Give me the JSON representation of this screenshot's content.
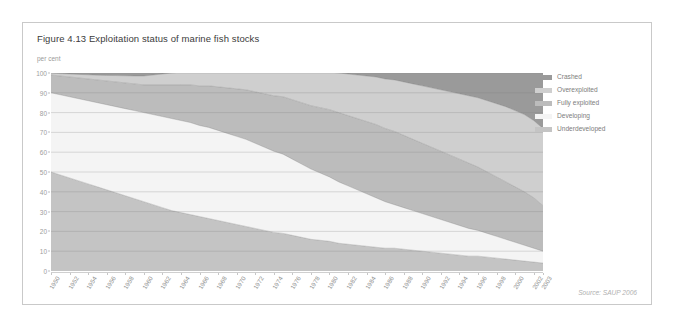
{
  "figure": {
    "title": "Figure 4.13 Exploitation status of marine fish stocks",
    "unit_label": "per cent",
    "source": "Source: SAUP 2006"
  },
  "legend": {
    "items": [
      {
        "label": "Crashed",
        "color": "#9a9a9a"
      },
      {
        "label": "Overexploited",
        "color": "#cfcfcf"
      },
      {
        "label": "Fully exploited",
        "color": "#bcbcbc"
      },
      {
        "label": "Developing",
        "color": "#f4f4f4"
      },
      {
        "label": "Underdeveloped",
        "color": "#c4c4c4"
      }
    ]
  },
  "chart_data": {
    "type": "area",
    "title": "Exploitation status of marine fish stocks",
    "xlabel": "",
    "ylabel": "per cent",
    "ylim": [
      0,
      100
    ],
    "xlim": [
      1950,
      2003
    ],
    "grid": true,
    "stacked": true,
    "legend_position": "right",
    "yticks": [
      0,
      10,
      20,
      30,
      40,
      50,
      60,
      70,
      80,
      90,
      100
    ],
    "x": [
      1950,
      1951,
      1952,
      1953,
      1954,
      1955,
      1956,
      1957,
      1958,
      1959,
      1960,
      1961,
      1962,
      1963,
      1964,
      1965,
      1966,
      1967,
      1968,
      1969,
      1970,
      1971,
      1972,
      1973,
      1974,
      1975,
      1976,
      1977,
      1978,
      1979,
      1980,
      1981,
      1982,
      1983,
      1984,
      1985,
      1986,
      1987,
      1988,
      1989,
      1990,
      1991,
      1992,
      1993,
      1994,
      1995,
      1996,
      1997,
      1998,
      1999,
      2000,
      2001,
      2002,
      2003
    ],
    "xtick_labels": [
      "1950",
      "1952",
      "1954",
      "1956",
      "1958",
      "1960",
      "1962",
      "1964",
      "1966",
      "1968",
      "1970",
      "1972",
      "1974",
      "1976",
      "1978",
      "1980",
      "1982",
      "1984",
      "1986",
      "1988",
      "1990",
      "1992",
      "1994",
      "1996",
      "1998",
      "2000",
      "2002",
      "2003"
    ],
    "series": [
      {
        "name": "Underdeveloped",
        "color": "#c4c4c4",
        "values": [
          50,
          48.5,
          47,
          45.5,
          44,
          42.5,
          41,
          39.5,
          38,
          36.5,
          35,
          33.5,
          32,
          30.5,
          29.5,
          28.5,
          27.5,
          26.5,
          25.5,
          24.5,
          23.5,
          22.5,
          21.5,
          20.5,
          19.5,
          19,
          18,
          17,
          16,
          15.5,
          15,
          14,
          13.5,
          13,
          12.5,
          12,
          11.5,
          11.5,
          11,
          10.5,
          10,
          9.5,
          9,
          8.5,
          8,
          7.5,
          7.5,
          7,
          6.5,
          6,
          5.5,
          5,
          4.5,
          4
        ]
      },
      {
        "name": "Developing",
        "color": "#f4f4f4",
        "values": [
          40,
          40.5,
          41,
          41.5,
          42,
          42.5,
          43,
          43.5,
          44,
          44.5,
          45,
          45.5,
          46,
          46.5,
          46.5,
          46.5,
          46,
          46,
          45.5,
          45,
          44.5,
          44,
          43,
          42,
          41,
          40,
          38.5,
          37,
          35.5,
          34,
          32.5,
          31,
          29.5,
          28,
          26.5,
          25,
          23.5,
          22,
          21,
          20,
          19,
          18,
          17,
          16,
          15,
          14,
          13,
          12,
          11,
          10,
          9,
          8,
          7,
          6
        ]
      },
      {
        "name": "Fully exploited",
        "color": "#bcbcbc",
        "values": [
          9,
          9.5,
          10,
          10.5,
          11,
          11.5,
          12,
          12.5,
          13,
          13.5,
          14,
          15,
          16,
          17,
          18,
          19,
          20,
          21,
          22,
          23,
          24,
          25,
          26,
          27,
          28,
          29,
          30,
          31,
          32,
          33,
          34,
          35,
          35.5,
          36,
          36.5,
          37,
          37,
          37,
          36.5,
          36,
          35.5,
          35,
          34.5,
          34,
          33.5,
          33,
          32,
          31,
          30,
          29,
          28,
          27,
          25.5,
          23
        ]
      },
      {
        "name": "Overexploited",
        "color": "#cfcfcf",
        "values": [
          1,
          1.2,
          1.5,
          1.8,
          2.1,
          2.4,
          2.8,
          3.2,
          3.6,
          4,
          4.5,
          5,
          5.5,
          6,
          6.5,
          7,
          7.5,
          8,
          8.5,
          9,
          9.5,
          10,
          11,
          12,
          13,
          14,
          15,
          16,
          17,
          18,
          19,
          20,
          21,
          22,
          23,
          24,
          25,
          26,
          27,
          28,
          29,
          30,
          31,
          32,
          33,
          34,
          35,
          36,
          37,
          38,
          38.5,
          39,
          39,
          39
        ]
      },
      {
        "name": "Crashed",
        "color": "#9a9a9a",
        "values": [
          0,
          0.3,
          0.5,
          0.7,
          0.9,
          1.1,
          1.2,
          1.3,
          1.4,
          1.5,
          1.5,
          1,
          0.5,
          0,
          0.5,
          1,
          1.5,
          2,
          2.5,
          3,
          3.5,
          4,
          4.5,
          5,
          5.5,
          6,
          7,
          8,
          9.5,
          11,
          12.5,
          14,
          15.5,
          17,
          18.5,
          20,
          21.5,
          23,
          24.5,
          25.5,
          27,
          28,
          29,
          30,
          31,
          32,
          33.5,
          35,
          36.5,
          38,
          39.5,
          41,
          42.5,
          44
        ]
      }
    ]
  }
}
